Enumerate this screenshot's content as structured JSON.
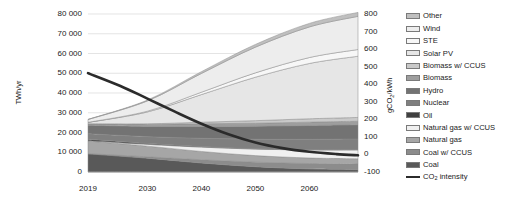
{
  "chart_data": {
    "type": "area",
    "title": "",
    "xlabel": "",
    "ylabel": "TWh/yr",
    "y2label": "gCO2/kWh",
    "x": [
      2019,
      2030,
      2040,
      2050,
      2060,
      2069
    ],
    "xlim": [
      2019,
      2069
    ],
    "ylim": [
      0,
      80000
    ],
    "y2lim": [
      -100,
      800
    ],
    "grid": true,
    "legend_position": "right",
    "x_ticks": [
      "2019",
      "2030",
      "2040",
      "2050",
      "2060"
    ],
    "y_ticks": [
      "0",
      "10 000",
      "20 000",
      "30 000",
      "40 000",
      "50 000",
      "60 000",
      "70 000",
      "80 000"
    ],
    "y2_ticks": [
      "-100",
      "0",
      "100",
      "200",
      "300",
      "400",
      "500",
      "600",
      "700",
      "800"
    ],
    "stack_order_bottom_to_top": [
      "Coal",
      "Coal w/ CCUS",
      "Natural gas",
      "Natural gas w/ CCUS",
      "Oil",
      "Nuclear",
      "Hydro",
      "Biomass",
      "Biomass w/ CCUS",
      "Solar PV",
      "STE",
      "Wind",
      "Other"
    ],
    "series": [
      {
        "name": "Coal",
        "color": "#595959",
        "values": [
          9200,
          7000,
          4600,
          2700,
          1600,
          1200
        ]
      },
      {
        "name": "Coal w/ CCUS",
        "color": "#8c8c8c",
        "values": [
          100,
          700,
          1600,
          2300,
          2700,
          2900
        ]
      },
      {
        "name": "Natural gas",
        "color": "#a6a6a6",
        "values": [
          6400,
          5400,
          4200,
          3300,
          2800,
          2600
        ]
      },
      {
        "name": "Natural gas w/ CCUS",
        "color": "#f0f0f0",
        "values": [
          100,
          900,
          2200,
          3300,
          4100,
          4500
        ]
      },
      {
        "name": "Oil",
        "color": "#404040",
        "values": [
          800,
          500,
          300,
          200,
          150,
          120
        ]
      },
      {
        "name": "Nuclear",
        "color": "#7f7f7f",
        "values": [
          2800,
          3400,
          4200,
          4800,
          5200,
          5400
        ]
      },
      {
        "name": "Hydro",
        "color": "#737373",
        "values": [
          4300,
          5200,
          6000,
          6600,
          7000,
          7200
        ]
      },
      {
        "name": "Biomass",
        "color": "#9e9e9e",
        "values": [
          700,
          1000,
          1300,
          1500,
          1700,
          1800
        ]
      },
      {
        "name": "Biomass w/ CCUS",
        "color": "#c9c9c9",
        "values": [
          0,
          300,
          800,
          1300,
          1700,
          1900
        ]
      },
      {
        "name": "Solar PV",
        "color": "#e6e6e6",
        "values": [
          700,
          6000,
          14000,
          22000,
          28000,
          31000
        ]
      },
      {
        "name": "STE",
        "color": "#f7f7f7",
        "values": [
          50,
          400,
          1200,
          2200,
          3000,
          3400
        ]
      },
      {
        "name": "Wind",
        "color": "#ededed",
        "values": [
          1400,
          5200,
          9500,
          13000,
          15500,
          16800
        ]
      },
      {
        "name": "Other",
        "color": "#bfbfbf",
        "values": [
          100,
          400,
          900,
          1400,
          1800,
          2000
        ]
      }
    ],
    "line_series": {
      "name": "CO2 intensity",
      "color": "#2b2b2b",
      "axis": "right",
      "unit": "gCO2/kWh",
      "x": [
        2019,
        2025,
        2030,
        2035,
        2040,
        2045,
        2050,
        2055,
        2060,
        2065,
        2069
      ],
      "values": [
        463,
        390,
        318,
        245,
        175,
        115,
        68,
        36,
        15,
        2,
        -5
      ]
    }
  },
  "axes": {
    "left_title": "TWh/yr",
    "right_title": "gCO₂/kWh"
  },
  "legend": {
    "items": [
      {
        "label": "Other",
        "color": "#bfbfbf",
        "type": "swatch"
      },
      {
        "label": "Wind",
        "color": "#ededed",
        "type": "swatch"
      },
      {
        "label": "STE",
        "color": "#f7f7f7",
        "type": "swatch"
      },
      {
        "label": "Solar PV",
        "color": "#e6e6e6",
        "type": "swatch"
      },
      {
        "label": "Biomass w/ CCUS",
        "color": "#c9c9c9",
        "type": "swatch"
      },
      {
        "label": "Biomass",
        "color": "#9e9e9e",
        "type": "swatch"
      },
      {
        "label": "Hydro",
        "color": "#737373",
        "type": "swatch"
      },
      {
        "label": "Nuclear",
        "color": "#7f7f7f",
        "type": "swatch"
      },
      {
        "label": "Oil",
        "color": "#404040",
        "type": "swatch"
      },
      {
        "label": "Natural gas w/ CCUS",
        "color": "#f0f0f0",
        "type": "swatch"
      },
      {
        "label": "Natural gas",
        "color": "#a6a6a6",
        "type": "swatch"
      },
      {
        "label": "Coal w/ CCUS",
        "color": "#8c8c8c",
        "type": "swatch"
      },
      {
        "label": "Coal",
        "color": "#595959",
        "type": "swatch"
      },
      {
        "label": "CO₂ intensity",
        "color": "#2b2b2b",
        "type": "line"
      }
    ]
  }
}
